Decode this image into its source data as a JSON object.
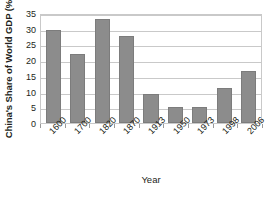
{
  "chart_data": {
    "type": "bar",
    "title": "",
    "xlabel": "Year",
    "ylabel": "China's Share of World GDP (%)",
    "categories": [
      "1600",
      "1700",
      "1820",
      "1870",
      "1913",
      "1950",
      "1973",
      "1998",
      "2006"
    ],
    "values": [
      29.5,
      21.9,
      33.0,
      27.6,
      9.2,
      5.2,
      5.2,
      11.3,
      16.7
    ],
    "ylim": [
      0,
      35
    ],
    "ytick_labels": [
      "0",
      "5",
      "10",
      "15",
      "20",
      "25",
      "30",
      "35"
    ],
    "ytick_values": [
      0,
      5,
      10,
      15,
      20,
      25,
      30,
      35
    ],
    "grid": "horizontal",
    "legend": "none",
    "bar_color": "#8c8c8c",
    "bar_edge_color": "#7c7c7c",
    "axis_color": "#c9c9c9",
    "text_color": "#231f20",
    "background": "#ffffff"
  }
}
